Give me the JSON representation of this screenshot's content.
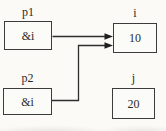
{
  "diagram": {
    "type": "pointer-diagram",
    "boxes": [
      {
        "id": "p1",
        "label": "p1",
        "value": "&i"
      },
      {
        "id": "i",
        "label": "i",
        "value": "10"
      },
      {
        "id": "p2",
        "label": "p2",
        "value": "&i"
      },
      {
        "id": "j",
        "label": "j",
        "value": "20"
      }
    ],
    "arrows": [
      {
        "from": "p1",
        "to": "i"
      },
      {
        "from": "p2",
        "to": "i"
      }
    ],
    "colors": {
      "ink": "#2a2a2a",
      "box_border": "#3c3c3c",
      "background": "#fbfaf6"
    }
  }
}
